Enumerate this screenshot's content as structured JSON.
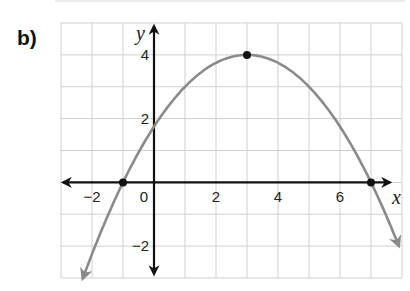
{
  "part_label": "b)",
  "chart_data": {
    "type": "line",
    "title": "",
    "xlabel": "x",
    "ylabel": "y",
    "xlim": [
      -3,
      8
    ],
    "ylim": [
      -3,
      5
    ],
    "grid": true,
    "x_ticks": [
      {
        "value": -2,
        "label": "−2"
      },
      {
        "value": 0,
        "label": "0"
      },
      {
        "value": 2,
        "label": "2"
      },
      {
        "value": 4,
        "label": "4"
      },
      {
        "value": 6,
        "label": "6"
      }
    ],
    "y_ticks": [
      {
        "value": 4,
        "label": "4"
      },
      {
        "value": 2,
        "label": "2"
      },
      {
        "value": -2,
        "label": "−2"
      }
    ],
    "series": [
      {
        "name": "parabola",
        "equation": "y = -0.25(x - 3)^2 + 4",
        "color": "#8a8a8a",
        "x_range": [
          -2.3,
          7.9
        ],
        "arrows_at_ends": true
      }
    ],
    "points": [
      {
        "name": "vertex",
        "x": 3,
        "y": 4
      },
      {
        "name": "x-intercept-left",
        "x": -1,
        "y": 0
      },
      {
        "name": "x-intercept-right",
        "x": 7,
        "y": 0
      }
    ],
    "colors": {
      "grid": "#cfcfcf",
      "axes": "#111111",
      "curve": "#8a8a8a",
      "points": "#111111"
    }
  }
}
